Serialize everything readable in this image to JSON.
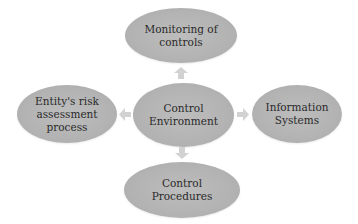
{
  "diagram": {
    "center": {
      "label": "Control\nEnvironment"
    },
    "top": {
      "label": "Monitoring of\ncontrols"
    },
    "left": {
      "label": "Entity's risk\nassessment\nprocess"
    },
    "right": {
      "label": "Information\nSystems"
    },
    "bottom": {
      "label": "Control\nProcedures"
    },
    "arrows": [
      "up",
      "left",
      "right",
      "down"
    ],
    "colors": {
      "node_fill": "#b3b3b3",
      "arrow_fill": "#d2d2d2",
      "text": "#2a2a2a"
    }
  }
}
